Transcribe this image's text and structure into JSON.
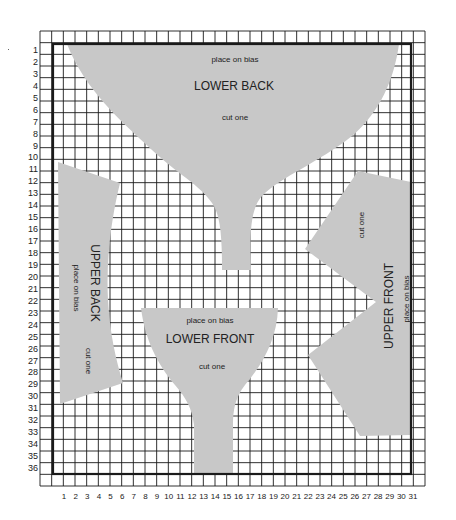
{
  "diagram": {
    "type": "sewing-pattern-grid",
    "grid": {
      "columns": 31,
      "rows": 36,
      "row_labels": [
        "1",
        "2",
        "3",
        "4",
        "5",
        "6",
        "7",
        "8",
        "9",
        "10",
        "11",
        "12",
        "13",
        "14",
        "15",
        "16",
        "17",
        "18",
        "19",
        "20",
        "21",
        "22",
        "23",
        "24",
        "25",
        "26",
        "27",
        "28",
        "29",
        "30",
        "31",
        "32",
        "33",
        "34",
        "35",
        "36"
      ],
      "column_labels": [
        "1",
        "2",
        "3",
        "4",
        "5",
        "6",
        "7",
        "8",
        "9",
        "10",
        "11",
        "12",
        "13",
        "14",
        "15",
        "16",
        "17",
        "18",
        "19",
        "20",
        "21",
        "22",
        "23",
        "24",
        "25",
        "26",
        "27",
        "28",
        "29",
        "30",
        "31"
      ],
      "line_color": "#1a1a1a",
      "background": "#ffffff"
    },
    "piece_fill": "#c8c8c8",
    "pieces": {
      "lower_back": {
        "name": "LOWER BACK",
        "bias": "place on bias",
        "cut": "cut one"
      },
      "upper_back": {
        "name": "UPPER BACK",
        "bias": "place on bias",
        "cut": "cut one"
      },
      "lower_front": {
        "name": "LOWER FRONT",
        "bias": "place on bias",
        "cut": "cut one"
      },
      "upper_front": {
        "name": "UPPER FRONT",
        "bias": "place on bias",
        "cut": "cut one"
      }
    }
  }
}
